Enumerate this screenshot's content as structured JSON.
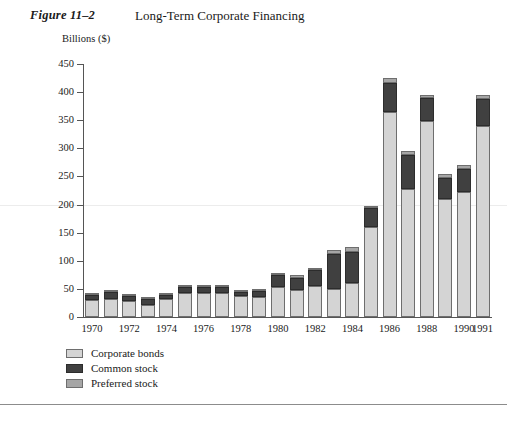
{
  "figure": {
    "number": "Figure 11–2",
    "title": "Long-Term Corporate Financing"
  },
  "colors": {
    "corporate_bonds": "#d4d4d4",
    "common_stock": "#404040",
    "preferred_stock": "#a6a6a6",
    "axis": "#555555",
    "bar_outline": "#6e6e6e",
    "rule": "#8c8c8c"
  },
  "chart_data": {
    "type": "bar",
    "stacked": true,
    "title": "Long-Term Corporate Financing",
    "xlabel": "",
    "ylabel": "Billions ($)",
    "ylim": [
      0,
      450
    ],
    "yticks": [
      0,
      50,
      100,
      150,
      200,
      250,
      300,
      350,
      400,
      450
    ],
    "ytick_labels": [
      "0",
      "50",
      "100",
      "150",
      "200",
      "250",
      "300",
      "350",
      "400",
      "450"
    ],
    "grid": false,
    "legend_position": "below-left",
    "categories": [
      "1970",
      "1971",
      "1972",
      "1973",
      "1974",
      "1975",
      "1976",
      "1977",
      "1978",
      "1979",
      "1980",
      "1981",
      "1982",
      "1983",
      "1984",
      "1985",
      "1986",
      "1987",
      "1988",
      "1989",
      "1990",
      "1991"
    ],
    "xtick_labels": [
      "1970",
      "1972",
      "1974",
      "1976",
      "1978",
      "1980",
      "1982",
      "1984",
      "1986",
      "1988",
      "1990",
      "1991"
    ],
    "series": [
      {
        "name": "Corporate bonds",
        "color": "#d4d4d4",
        "values": [
          30,
          32,
          28,
          22,
          32,
          42,
          43,
          43,
          37,
          36,
          54,
          48,
          56,
          50,
          60,
          160,
          365,
          228,
          348,
          210,
          222,
          340
        ]
      },
      {
        "name": "Common stock",
        "color": "#404040",
        "values": [
          10,
          13,
          10,
          10,
          8,
          11,
          11,
          11,
          8,
          10,
          20,
          22,
          27,
          62,
          56,
          34,
          52,
          60,
          41,
          38,
          42,
          47
        ]
      },
      {
        "name": "Preferred stock",
        "color": "#a6a6a6",
        "values": [
          3,
          3,
          2,
          2,
          2,
          3,
          3,
          3,
          3,
          3,
          5,
          5,
          5,
          8,
          8,
          3,
          8,
          7,
          6,
          6,
          7,
          8
        ]
      }
    ],
    "totals": [
      43,
      48,
      40,
      34,
      42,
      56,
      57,
      57,
      48,
      49,
      79,
      75,
      88,
      120,
      124,
      197,
      425,
      295,
      395,
      254,
      271,
      395
    ]
  },
  "legend": {
    "items": [
      {
        "label": "Corporate bonds",
        "swatch": "corporate-bonds"
      },
      {
        "label": "Common stock",
        "swatch": "common-stock"
      },
      {
        "label": "Preferred stock",
        "swatch": "preferred-stock"
      }
    ]
  }
}
